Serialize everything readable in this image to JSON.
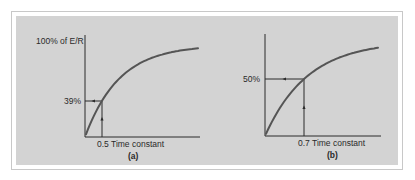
{
  "figure": {
    "panels": [
      {
        "id": "a",
        "caption": "(a)",
        "y_top_label": "100% of E/R",
        "marker_y_label": "39%",
        "marker_x_label": "0.5 Time constant"
      },
      {
        "id": "b",
        "caption": "(b)",
        "y_top_label": "",
        "marker_y_label": "50%",
        "marker_x_label": "0.7 Time constant"
      }
    ],
    "colors": {
      "background": "#ffffff",
      "panel": "#d3d3d3",
      "frame": "#c8c8c8",
      "curve": "#555555",
      "axis": "#2a2a2a"
    }
  },
  "chart_data": [
    {
      "type": "line",
      "title": "(a)",
      "xlabel": "Time constant",
      "ylabel": "% of E/R",
      "y_top_label": "100% of E/R",
      "series": [
        {
          "name": "charging curve",
          "x": [
            0,
            0.5,
            1,
            1.5,
            2,
            2.5,
            3,
            3.35
          ],
          "values": [
            0,
            39,
            63,
            78,
            86,
            92,
            95,
            96
          ]
        }
      ],
      "annotations": [
        {
          "x": 0.5,
          "y": 39,
          "x_label": "0.5 Time constant",
          "y_label": "39%"
        }
      ],
      "ylim": [
        0,
        100
      ]
    },
    {
      "type": "line",
      "title": "(b)",
      "xlabel": "Time constant",
      "ylabel": "% of E/R",
      "series": [
        {
          "name": "charging curve",
          "x": [
            0,
            0.35,
            0.7,
            1.05,
            1.4,
            1.75,
            2.05
          ],
          "values": [
            0,
            31,
            50,
            63,
            71,
            76,
            80
          ]
        }
      ],
      "annotations": [
        {
          "x": 0.7,
          "y": 50,
          "x_label": "0.7 Time constant",
          "y_label": "50%"
        }
      ],
      "ylim": [
        0,
        100
      ]
    }
  ],
  "geometry": {
    "a": {
      "ox": 85,
      "oy": 137,
      "axis_top": 35,
      "axis_right": 200,
      "mx": 102,
      "my": 101,
      "amp": 92,
      "tau": 34,
      "x_end": 199
    },
    "b": {
      "ox": 265,
      "oy": 136,
      "axis_top": 34,
      "axis_right": 381,
      "mx": 304,
      "my": 79,
      "amp": 95,
      "tau": 42.6,
      "x_end": 379
    }
  }
}
